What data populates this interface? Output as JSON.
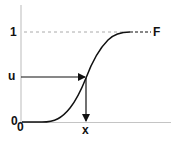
{
  "diagram": {
    "labels": {
      "y_one": "1",
      "y_u": "u",
      "y_zero": "0",
      "x_zero": "0",
      "x_value": "x",
      "curve_name": "F"
    },
    "elements": {
      "curve": "sigmoid cumulative distribution function F rising from 0 to 1",
      "upper_bound_line": "dashed horizontal line at level 1",
      "horizontal_arrow": "arrow from u on the vertical axis to the curve",
      "vertical_arrow": "arrow from the curve down to x on the horizontal axis"
    },
    "colors": {
      "ink": "#111111",
      "axis": "#bbbbbb",
      "dashed": "#999999"
    }
  }
}
